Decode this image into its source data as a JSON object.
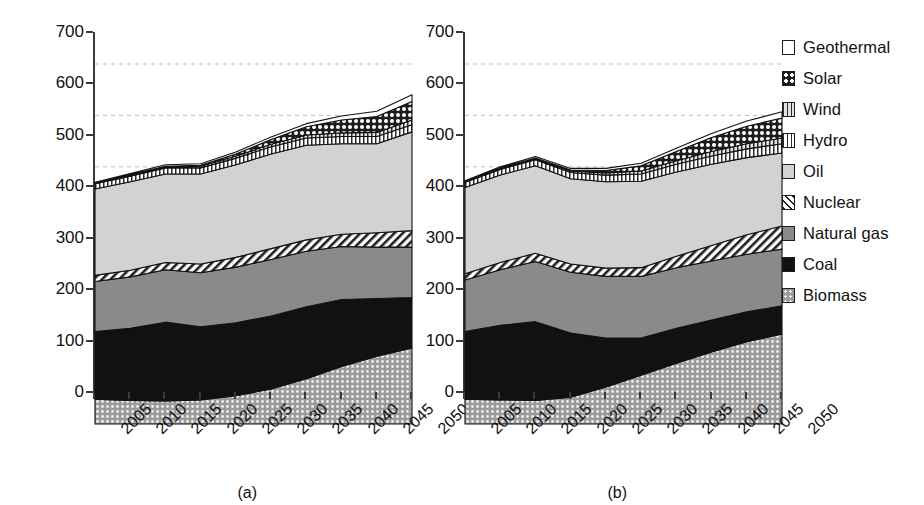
{
  "chart_data": {
    "type": "area",
    "title": "",
    "xlabel": "",
    "ylabel": "Primary energy production (EJ)",
    "ylim": [
      0,
      700
    ],
    "ytick_values": [
      0,
      100,
      200,
      300,
      400,
      500,
      600,
      700
    ],
    "ytick_labels": [
      "0",
      "100",
      "200",
      "300",
      "400",
      "500",
      "600",
      "700"
    ],
    "categories": [
      "2005",
      "2010",
      "2015",
      "2020",
      "2025",
      "2030",
      "2035",
      "2040",
      "2045",
      "2050"
    ],
    "x": [
      2005,
      2010,
      2015,
      2020,
      2025,
      2030,
      2035,
      2040,
      2045,
      2050
    ],
    "grid": "horizontal-dashed",
    "legend_position": "right",
    "stack_order_bottom_to_top": [
      "Biomass",
      "Coal",
      "Natural gas",
      "Nuclear",
      "Oil",
      "Hydro",
      "Wind",
      "Solar",
      "Geothermal"
    ],
    "panels": [
      {
        "id": "a",
        "caption": "(a)",
        "series": [
          {
            "name": "Biomass",
            "values": [
              48,
              46,
              45,
              47,
              55,
              68,
              88,
              112,
              132,
              148
            ]
          },
          {
            "name": "Coal",
            "values": [
              132,
              140,
              153,
              142,
              142,
              142,
              140,
              130,
              112,
              98
            ]
          },
          {
            "name": "Natural gas",
            "values": [
              97,
              100,
              102,
              105,
              108,
              110,
              108,
              103,
              100,
              98
            ]
          },
          {
            "name": "Nuclear",
            "values": [
              12,
              13,
              14,
              17,
              19,
              21,
              22,
              24,
              28,
              32
            ]
          },
          {
            "name": "Oil",
            "values": [
              168,
              172,
              172,
              175,
              180,
              184,
              184,
              176,
              173,
              192
            ]
          },
          {
            "name": "Hydro",
            "values": [
              10,
              11,
              12,
              12,
              13,
              14,
              14,
              14,
              14,
              14
            ]
          },
          {
            "name": "Wind",
            "values": [
              1,
              2,
              2,
              3,
              4,
              5,
              6,
              7,
              8,
              9
            ]
          },
          {
            "name": "Solar",
            "values": [
              0,
              1,
              1,
              2,
              4,
              9,
              16,
              25,
              31,
              36
            ]
          },
          {
            "name": "Geothermal",
            "values": [
              2,
              2,
              3,
              3,
              4,
              5,
              6,
              8,
              10,
              13
            ]
          }
        ],
        "totals": [
          470,
          487,
          504,
          506,
          529,
          558,
          584,
          599,
          608,
          640
        ]
      },
      {
        "id": "b",
        "caption": "(b)",
        "series": [
          {
            "name": "Biomass",
            "values": [
              48,
              47,
              46,
              52,
              72,
              95,
              118,
              140,
              160,
              175
            ]
          },
          {
            "name": "Coal",
            "values": [
              132,
              145,
              153,
              125,
              95,
              72,
              68,
              62,
              58,
              55
            ]
          },
          {
            "name": "Natural gas",
            "values": [
              100,
              108,
              117,
              118,
              120,
              120,
              118,
              115,
              112,
              110
            ]
          },
          {
            "name": "Nuclear",
            "values": [
              12,
              14,
              16,
              16,
              16,
              17,
              22,
              30,
              38,
              45
            ]
          },
          {
            "name": "Oil",
            "values": [
              168,
              170,
              170,
              166,
              168,
              168,
              164,
              158,
              150,
              142
            ]
          },
          {
            "name": "Hydro",
            "values": [
              10,
              11,
              12,
              12,
              13,
              14,
              15,
              16,
              17,
              18
            ]
          },
          {
            "name": "Wind",
            "values": [
              1,
              2,
              2,
              3,
              4,
              6,
              7,
              9,
              10,
              11
            ]
          },
          {
            "name": "Solar",
            "values": [
              0,
              1,
              1,
              2,
              5,
              10,
              18,
              27,
              34,
              39
            ]
          },
          {
            "name": "Geothermal",
            "values": [
              2,
              2,
              3,
              3,
              4,
              5,
              6,
              8,
              10,
              12
            ]
          }
        ],
        "totals": [
          473,
          500,
          520,
          497,
          497,
          507,
          536,
          565,
          589,
          607
        ]
      }
    ]
  },
  "legend": {
    "items": [
      {
        "label": "Geothermal",
        "fill": "f-geothermal",
        "color": "#ffffff"
      },
      {
        "label": "Solar",
        "fill": "f-solar",
        "color": "#1d1d1d"
      },
      {
        "label": "Wind",
        "fill": "f-wind",
        "color": "#e3e3e3"
      },
      {
        "label": "Hydro",
        "fill": "f-hydro",
        "color": "#ffffff"
      },
      {
        "label": "Oil",
        "fill": "f-oil",
        "color": "#d2d2d2"
      },
      {
        "label": "Nuclear",
        "fill": "f-nuclear",
        "color": "#ffffff"
      },
      {
        "label": "Natural gas",
        "fill": "f-naturalgas",
        "color": "#8a8a8a"
      },
      {
        "label": "Coal",
        "fill": "f-coal",
        "color": "#111111"
      },
      {
        "label": "Biomass",
        "fill": "f-biomass",
        "color": "#9b9b9b"
      }
    ]
  }
}
